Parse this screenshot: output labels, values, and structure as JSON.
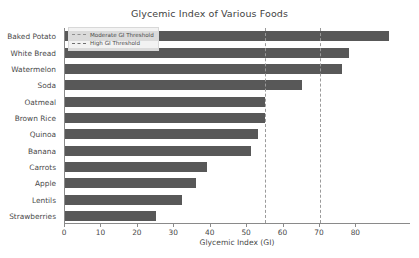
{
  "chart_data": {
    "type": "bar",
    "orientation": "horizontal",
    "title": "Glycemic Index of Various Foods",
    "xlabel": "Glycemic Index (GI)",
    "ylabel": "",
    "categories": [
      "Baked Potato",
      "White Bread",
      "Watermelon",
      "Soda",
      "Oatmeal",
      "Brown Rice",
      "Quinoa",
      "Banana",
      "Carrots",
      "Apple",
      "Lentils",
      "Strawberries"
    ],
    "values": [
      89,
      78,
      76,
      65,
      55,
      55,
      53,
      51,
      39,
      36,
      32,
      25
    ],
    "xlim": [
      0,
      95
    ],
    "xticks": [
      0,
      10,
      20,
      30,
      40,
      50,
      60,
      70,
      80
    ],
    "xticklabels": [
      "0",
      "10",
      "20",
      "30",
      "40",
      "50",
      "60",
      "70",
      "80"
    ],
    "grid": false,
    "bar_color": "#585858",
    "annotations": [
      {
        "name": "moderate-gi-threshold",
        "value": 55,
        "style": "dashed",
        "color": "#9a9a9a"
      },
      {
        "name": "high-gi-threshold",
        "value": 70,
        "style": "dashed",
        "color": "#9a9a9a"
      }
    ],
    "legend": {
      "position": "upper left",
      "entries": [
        {
          "label": "Moderate GI Threshold",
          "style": "dashed"
        },
        {
          "label": "High GI Threshold",
          "style": "dashed"
        }
      ]
    }
  }
}
